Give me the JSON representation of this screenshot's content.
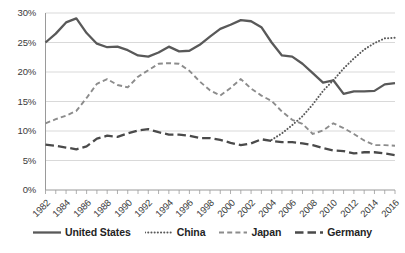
{
  "chart_data": {
    "type": "line",
    "title": "",
    "xlabel": "",
    "ylabel": "",
    "ylim": [
      0,
      30
    ],
    "xlim": [
      1982,
      2016
    ],
    "grid": true,
    "legend_position": "bottom",
    "ytick_labels": [
      "0%",
      "5%",
      "10%",
      "15%",
      "20%",
      "25%",
      "30%"
    ],
    "ytick_values": [
      0,
      5,
      10,
      15,
      20,
      25,
      30
    ],
    "xtick_labels": [
      "1982",
      "1984",
      "1986",
      "1988",
      "1990",
      "1992",
      "1994",
      "1996",
      "1998",
      "2000",
      "2002",
      "2004",
      "2006",
      "2008",
      "2010",
      "2012",
      "2014",
      "2016"
    ],
    "xtick_values": [
      1982,
      1984,
      1986,
      1988,
      1990,
      1992,
      1994,
      1996,
      1998,
      2000,
      2002,
      2004,
      2006,
      2008,
      2010,
      2012,
      2014,
      2016
    ],
    "x": [
      1982,
      1983,
      1984,
      1985,
      1986,
      1987,
      1988,
      1989,
      1990,
      1991,
      1992,
      1993,
      1994,
      1995,
      1996,
      1997,
      1998,
      1999,
      2000,
      2001,
      2002,
      2003,
      2004,
      2005,
      2006,
      2007,
      2008,
      2009,
      2010,
      2011,
      2012,
      2013,
      2014,
      2015,
      2016
    ],
    "series": [
      {
        "name": "United States",
        "style": "solid",
        "color": "#595959",
        "values": [
          25.0,
          26.5,
          28.4,
          29.1,
          26.6,
          24.8,
          24.2,
          24.3,
          23.7,
          22.8,
          22.6,
          23.3,
          24.3,
          23.5,
          23.6,
          24.6,
          26.0,
          27.3,
          28.0,
          28.8,
          28.6,
          27.6,
          25.0,
          22.8,
          22.6,
          21.4,
          19.8,
          18.2,
          18.6,
          16.3,
          16.7,
          16.7,
          16.8,
          17.9,
          18.1
        ]
      },
      {
        "name": "China",
        "style": "dotted",
        "color": "#595959",
        "values": [
          null,
          null,
          null,
          null,
          null,
          null,
          null,
          null,
          null,
          null,
          null,
          null,
          null,
          null,
          null,
          null,
          null,
          null,
          null,
          null,
          null,
          null,
          8.5,
          9.6,
          11.0,
          12.5,
          14.5,
          16.8,
          18.6,
          20.6,
          22.3,
          23.8,
          24.9,
          25.7,
          25.8
        ]
      },
      {
        "name": "Japan",
        "style": "dashed",
        "color": "#8c8c8c",
        "values": [
          11.3,
          12.0,
          12.6,
          13.4,
          15.6,
          18.0,
          18.8,
          17.8,
          17.4,
          19.2,
          20.3,
          21.4,
          21.5,
          21.4,
          20.2,
          18.4,
          16.9,
          16.0,
          17.3,
          18.8,
          17.2,
          16.0,
          15.1,
          13.3,
          11.9,
          11.2,
          9.5,
          10.1,
          11.3,
          10.5,
          9.5,
          8.4,
          7.6,
          7.6,
          7.5
        ]
      },
      {
        "name": "Germany",
        "style": "longdash",
        "color": "#4a4a4a",
        "values": [
          7.7,
          7.5,
          7.2,
          6.9,
          7.4,
          8.7,
          9.2,
          9.0,
          9.6,
          10.1,
          10.3,
          9.8,
          9.4,
          9.4,
          9.2,
          8.8,
          8.8,
          8.5,
          8.0,
          7.6,
          7.9,
          8.6,
          8.3,
          8.1,
          8.1,
          7.9,
          7.6,
          7.1,
          6.7,
          6.6,
          6.2,
          6.4,
          6.4,
          6.2,
          5.9
        ]
      }
    ]
  }
}
